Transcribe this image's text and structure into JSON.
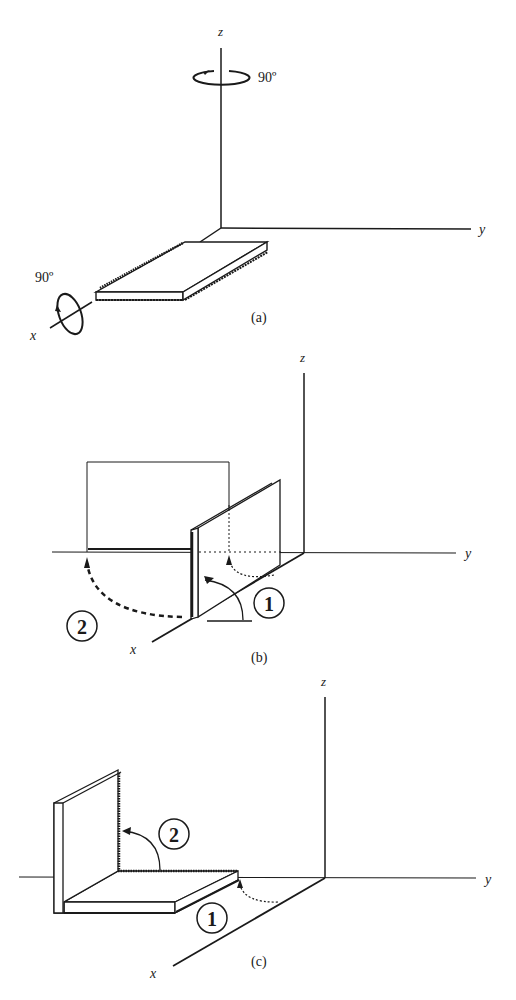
{
  "figure": {
    "panels": [
      {
        "id": "a",
        "caption": "(a)",
        "axes": {
          "x": "x",
          "y": "y",
          "z": "z"
        },
        "rotations": [
          {
            "axis": "z",
            "angle": "90º"
          },
          {
            "axis": "x",
            "angle": "90º"
          }
        ]
      },
      {
        "id": "b",
        "caption": "(b)",
        "axes": {
          "x": "x",
          "y": "y",
          "z": "z"
        },
        "steps": [
          "1",
          "2"
        ]
      },
      {
        "id": "c",
        "caption": "(c)",
        "axes": {
          "x": "x",
          "y": "y",
          "z": "z"
        },
        "steps": [
          "2",
          "1"
        ]
      }
    ]
  }
}
